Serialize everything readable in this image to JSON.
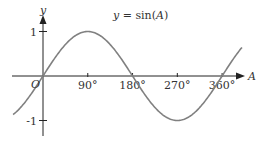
{
  "chart_data": {
    "type": "line",
    "title": "y = sin(A)",
    "title_parts": {
      "lhs": "y",
      "eq": " = sin(",
      "var": "A",
      "close": ")"
    },
    "xlabel": "A",
    "ylabel": "y",
    "origin_label": "O",
    "x_ticks": [
      {
        "value": 90,
        "label": "90°"
      },
      {
        "value": 180,
        "label": "180°"
      },
      {
        "value": 270,
        "label": "270°"
      },
      {
        "value": 360,
        "label": "360°"
      }
    ],
    "y_ticks": [
      {
        "value": 1,
        "label": "1"
      },
      {
        "value": -1,
        "label": "-1"
      }
    ],
    "xlim": [
      -60,
      400
    ],
    "ylim": [
      -1,
      1
    ],
    "grid": false,
    "legend": null,
    "series": [
      {
        "name": "sin(A)",
        "function": "sin",
        "x_range_deg": [
          -60,
          400
        ],
        "x": [
          -60,
          0,
          90,
          180,
          270,
          360,
          400
        ],
        "values": [
          -0.866,
          0,
          1,
          0,
          -1,
          0,
          0.643
        ]
      }
    ],
    "colors": {
      "curve": "#808080",
      "axis": "#222222",
      "text": "#333333"
    }
  }
}
